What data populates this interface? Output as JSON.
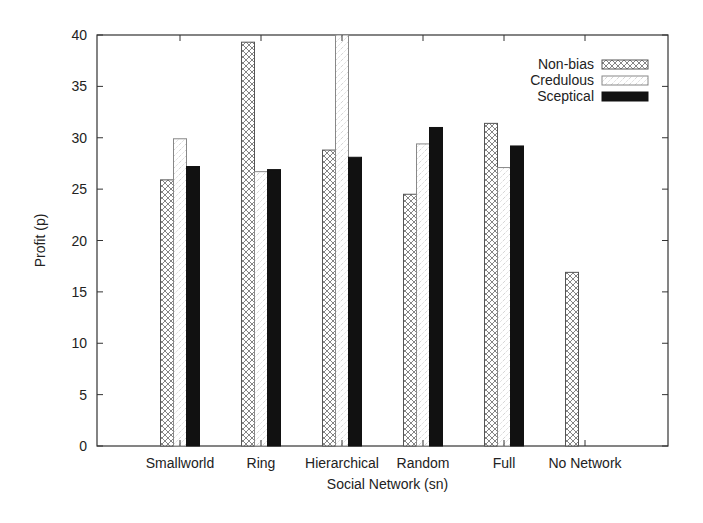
{
  "chart_data": {
    "type": "bar",
    "title": "",
    "xlabel": "Social Network (sn)",
    "ylabel": "Profit (p)",
    "ylim": [
      0,
      40
    ],
    "yticks": [
      0,
      5,
      10,
      15,
      20,
      25,
      30,
      35,
      40
    ],
    "grid": false,
    "legend_position": "top-right",
    "categories": [
      "Smallworld",
      "Ring",
      "Hierarchical",
      "Random",
      "Full",
      "No Network"
    ],
    "series": [
      {
        "name": "Non-bias",
        "pattern": "crosshatch",
        "values": [
          25.9,
          39.3,
          28.8,
          24.5,
          31.4,
          16.9
        ]
      },
      {
        "name": "Credulous",
        "pattern": "light-dotted-diagonal",
        "values": [
          29.9,
          26.7,
          40.0,
          29.4,
          27.1,
          null
        ]
      },
      {
        "name": "Sceptical",
        "pattern": "solid-black",
        "values": [
          27.2,
          26.9,
          28.1,
          31.0,
          29.2,
          null
        ]
      }
    ]
  },
  "colors": {
    "axis": "#333333",
    "nonbias_stroke": "#555555",
    "credulous_stroke": "#888888",
    "sceptical_fill": "#111111"
  }
}
